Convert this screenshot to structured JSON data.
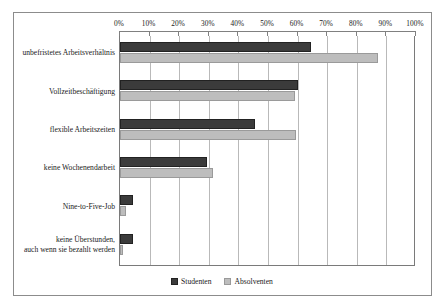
{
  "chart_data": {
    "type": "bar",
    "orientation": "horizontal",
    "title": "",
    "xlabel": "",
    "ylabel": "",
    "xlim": [
      0,
      100
    ],
    "grid": true,
    "x_axis_position": "top",
    "legend_position": "bottom-center",
    "tick_labels": [
      "0%",
      "10%",
      "20%",
      "30%",
      "40%",
      "50%",
      "60%",
      "70%",
      "80%",
      "90%",
      "100%"
    ],
    "tick_values": [
      0,
      10,
      20,
      30,
      40,
      50,
      60,
      70,
      80,
      90,
      100
    ],
    "categories": [
      "unbefristetes Arbeitsverhältnis",
      "Vollzeitbeschäftigung",
      "flexible Arbeitszeiten",
      "keine Wochenendarbeit",
      "Nine-to-Five-Job",
      "keine Überstunden,\nauch wenn sie bezahlt werden"
    ],
    "series": [
      {
        "name": "Studenten",
        "color": "#3b3b3b",
        "values": [
          64.5,
          60,
          45.5,
          29.5,
          4.5,
          4.5
        ]
      },
      {
        "name": "Absolventen",
        "color": "#bdbdbd",
        "values": [
          87,
          59,
          59.5,
          31.5,
          2,
          1
        ]
      }
    ]
  },
  "colors": {
    "studenten": "#3b3b3b",
    "absolventen": "#bdbdbd",
    "frame": "#8c8c8c",
    "gridline": "#b9b9b9",
    "axis": "#7a7a7a",
    "background": "#ffffff"
  }
}
